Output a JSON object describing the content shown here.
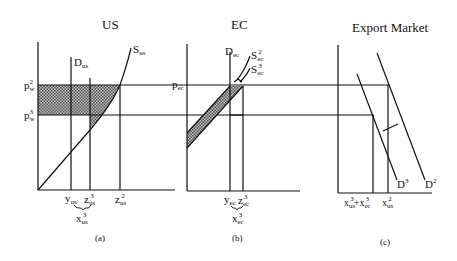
{
  "panels": {
    "a": {
      "title": "US",
      "caption": "(a)",
      "price_labels": {
        "p2": "p",
        "p2_sub": "w",
        "p2_sup": "2",
        "p3": "p",
        "p3_sub": "w",
        "p3_sup": "3"
      },
      "supply_label": "S",
      "supply_sub": "us",
      "demand_label": "D",
      "demand_sub": "us",
      "x_labels": [
        {
          "main": "y",
          "sub": "us",
          "sup": ""
        },
        {
          "main": "z",
          "sub": "us",
          "sup": "3"
        },
        {
          "main": "z",
          "sub": "us",
          "sup": "2"
        }
      ],
      "export_label": {
        "main": "x",
        "sub": "us",
        "sup": "3"
      }
    },
    "b": {
      "title": "EC",
      "caption": "(b)",
      "price_label": "p",
      "price_sub": "ec",
      "demand_label": "D",
      "demand_sub": "ec",
      "supply_labels": [
        {
          "main": "S",
          "sub": "ec",
          "sup": "2"
        },
        {
          "main": "S",
          "sub": "ec",
          "sup": "3"
        }
      ],
      "x_labels": [
        {
          "main": "y",
          "sub": "ec",
          "sup": ""
        },
        {
          "main": "z",
          "sub": "ec",
          "sup": "3"
        }
      ],
      "export_label": {
        "main": "x",
        "sub": "ec",
        "sup": "3"
      }
    },
    "c": {
      "title": "Export Market",
      "caption": "(c)",
      "demand_curves": [
        {
          "main": "D",
          "sup": "3"
        },
        {
          "main": "D",
          "sup": "2"
        }
      ],
      "x_labels": {
        "sum": {
          "a": "x",
          "a_sub": "us",
          "a_sup": "3",
          "plus": "+",
          "b": "x",
          "b_sub": "ec",
          "b_sup": "3"
        },
        "x2": {
          "main": "x",
          "sub": "us",
          "sup": "2"
        }
      }
    }
  },
  "colors": {
    "ink": "#111111",
    "shade": "#8a8a8a",
    "background": "#ffffff"
  }
}
